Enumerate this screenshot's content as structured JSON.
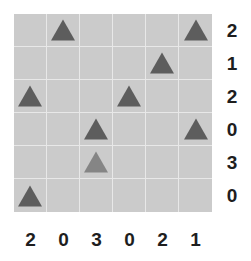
{
  "puzzle": {
    "rows": 6,
    "cols": 6,
    "colors": {
      "cell_bg": "#cbcbcb",
      "grid_line": "#e8e8e8",
      "tree": "#5d5d5d",
      "tree_highlight": "#858585",
      "clue_text": "#1e1e1e"
    },
    "cells": [
      [
        "",
        "tree",
        "",
        "",
        "",
        "tree"
      ],
      [
        "",
        "",
        "",
        "",
        "tree",
        ""
      ],
      [
        "tree",
        "",
        "",
        "tree",
        "",
        ""
      ],
      [
        "",
        "",
        "tree",
        "",
        "",
        "tree"
      ],
      [
        "",
        "",
        "tree-highlight",
        "",
        "",
        ""
      ],
      [
        "tree",
        "",
        "",
        "",
        "",
        ""
      ]
    ],
    "row_clues": [
      "2",
      "1",
      "2",
      "0",
      "3",
      "0"
    ],
    "col_clues": [
      "2",
      "0",
      "3",
      "0",
      "2",
      "1"
    ]
  }
}
